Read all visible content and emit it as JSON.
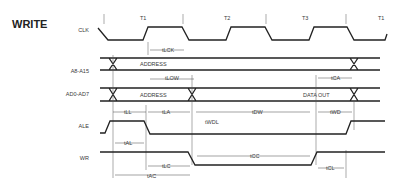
{
  "title": "WRITE",
  "clock_phases": [
    "T1",
    "T2",
    "T3",
    "T1"
  ],
  "signals": [
    {
      "name": "CLK",
      "label": "CLK"
    },
    {
      "name": "A8-A15",
      "label": "A8-A15",
      "bus_label": "ADDRESS"
    },
    {
      "name": "AD0-AD7",
      "label": "AD0-AD7",
      "bus_labels": [
        "ADDRESS",
        "DATA OUT"
      ]
    },
    {
      "name": "ALE",
      "label": "ALE"
    },
    {
      "name": "WR",
      "label": "WR"
    }
  ],
  "timing_parameters": {
    "tLCK": "tLCK",
    "tLOW": "tLOW",
    "tCA": "tCA",
    "tLL": "tLL",
    "tLA": "tLA",
    "tWDL": "tWDL",
    "tDW": "tDW",
    "tWD": "tWD",
    "tAL": "tAL",
    "tLC": "tLC",
    "tCC": "tCC",
    "tCL": "tCL",
    "tAC": "tAC"
  }
}
